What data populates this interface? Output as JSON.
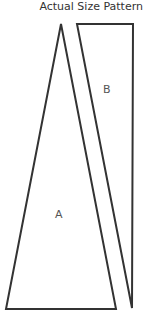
{
  "title": "Actual Size Pattern",
  "pieces": [
    {
      "label": "A",
      "shape": "triangle"
    },
    {
      "label": "B",
      "shape": "quadrilateral"
    }
  ],
  "colors": {
    "stroke": "#333333",
    "text": "#555555"
  }
}
